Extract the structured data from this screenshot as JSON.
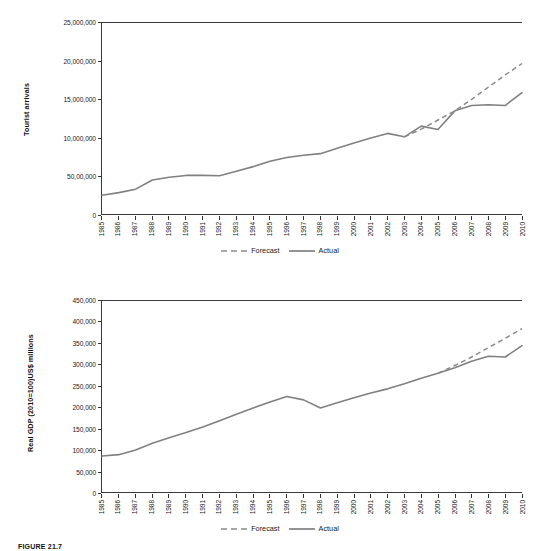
{
  "figure": {
    "caption": "FIGURE 21.7",
    "line_color": "#808080",
    "axis_color": "#3a3a3a"
  },
  "legend": {
    "forecast_label": "Forecast",
    "actual_label": "Actual"
  },
  "x_years": [
    "1985",
    "1986",
    "1987",
    "1988",
    "1989",
    "1990",
    "1991",
    "1992",
    "1993",
    "1994",
    "1995",
    "1996",
    "1997",
    "1998",
    "1999",
    "2000",
    "2001",
    "2002",
    "2003",
    "2004",
    "2005",
    "2006",
    "2007",
    "2008",
    "2009",
    "2010"
  ],
  "chart_data": [
    {
      "id": "tourist-arrivals",
      "type": "line",
      "title": "",
      "xlabel": "",
      "ylabel": "Tourist arrivals",
      "ylim": [
        0,
        25000000
      ],
      "ytick_values": [
        0,
        5000000,
        10000000,
        15000000,
        20000000,
        25000000
      ],
      "ytick_labels": [
        "0",
        "50,00,000",
        "10,000,000",
        "15,000,000",
        "20,000,000",
        "25,000,000"
      ],
      "grid": false,
      "legend_position": "bottom-center",
      "x": [
        "1985",
        "1986",
        "1987",
        "1988",
        "1989",
        "1990",
        "1991",
        "1992",
        "1993",
        "1994",
        "1995",
        "1996",
        "1997",
        "1998",
        "1999",
        "2000",
        "2001",
        "2002",
        "2003",
        "2004",
        "2005",
        "2006",
        "2007",
        "2008",
        "2009",
        "2010"
      ],
      "series": [
        {
          "name": "Actual",
          "style": "solid",
          "values": [
            2450000,
            2800000,
            3250000,
            4450000,
            4800000,
            5050000,
            5050000,
            5000000,
            5600000,
            6200000,
            6900000,
            7400000,
            7700000,
            7900000,
            8600000,
            9300000,
            9950000,
            10550000,
            10100000,
            11500000,
            11050000,
            13500000,
            14200000,
            14300000,
            14200000,
            15900000
          ]
        },
        {
          "name": "Forecast",
          "style": "dashed",
          "values": [
            null,
            null,
            null,
            null,
            null,
            null,
            null,
            null,
            null,
            null,
            null,
            null,
            null,
            null,
            null,
            null,
            null,
            null,
            10100000,
            11100000,
            12300000,
            13500000,
            15000000,
            16600000,
            18200000,
            19700000
          ]
        }
      ]
    },
    {
      "id": "real-gdp",
      "type": "line",
      "title": "",
      "xlabel": "",
      "ylabel": "Real GDP (2010=100)US$ millions",
      "ylim": [
        0,
        450000
      ],
      "ytick_values": [
        0,
        50000,
        100000,
        150000,
        200000,
        250000,
        300000,
        350000,
        400000,
        450000
      ],
      "ytick_labels": [
        "0",
        "50,000",
        "100,000",
        "150,000",
        "200,000",
        "250,000",
        "300,000",
        "350,000",
        "400,000",
        "450,000"
      ],
      "grid": false,
      "legend_position": "bottom-center",
      "x": [
        "1985",
        "1986",
        "1987",
        "1988",
        "1989",
        "1990",
        "1991",
        "1992",
        "1993",
        "1994",
        "1995",
        "1996",
        "1997",
        "1998",
        "1999",
        "2000",
        "2001",
        "2002",
        "2003",
        "2004",
        "2005",
        "2006",
        "2007",
        "2008",
        "2009",
        "2010"
      ],
      "series": [
        {
          "name": "Actual",
          "style": "solid",
          "values": [
            85000,
            88000,
            99000,
            115000,
            128000,
            140000,
            153000,
            168000,
            183000,
            198000,
            212000,
            225000,
            217000,
            198000,
            210000,
            222000,
            233000,
            243000,
            255000,
            268000,
            280000,
            293000,
            308000,
            320000,
            318000,
            345000
          ]
        },
        {
          "name": "Forecast",
          "style": "dashed",
          "values": [
            null,
            null,
            null,
            null,
            null,
            null,
            null,
            null,
            null,
            null,
            null,
            null,
            null,
            null,
            null,
            null,
            null,
            null,
            null,
            null,
            280000,
            298000,
            318000,
            340000,
            362000,
            385000
          ]
        }
      ]
    }
  ]
}
